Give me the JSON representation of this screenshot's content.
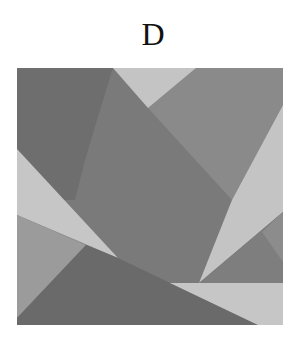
{
  "label": "D",
  "figure": {
    "colors": {
      "dark": "#6e6e6e",
      "dark_center": "#7a7a7a",
      "medium": "#888888",
      "medium_light": "#9b9b9b",
      "light": "#c4c4c4",
      "bottom_dark": "#6a6a6a"
    },
    "polygons": [
      {
        "name": "base-square",
        "fill": "#7a7a7a",
        "points": "17,68 283,68 283,325 17,325"
      },
      {
        "name": "upper-left-dark",
        "fill": "#6e6e6e",
        "points": "17,68 113,68 100,110 85,160 75,200 17,200"
      },
      {
        "name": "upper-right-medium",
        "fill": "#8a8a8a",
        "points": "148,108 196,68 283,68 283,105 232,200"
      },
      {
        "name": "top-light-triangle",
        "fill": "#c4c4c4",
        "points": "113,68 196,68 148,108"
      },
      {
        "name": "left-light-wedge",
        "fill": "#c6c6c6",
        "points": "17,149 118,258 17,215"
      },
      {
        "name": "bottom-left-medium",
        "fill": "#9b9b9b",
        "points": "17,215 86,245 17,318"
      },
      {
        "name": "bottom-dark",
        "fill": "#6a6a6a",
        "points": "86,245 118,258 258,325 17,325 17,318"
      },
      {
        "name": "right-light-wedge",
        "fill": "#c4c4c4",
        "points": "283,105 283,212 199,283 232,200"
      },
      {
        "name": "right-medium-triangle",
        "fill": "#7e7e7e",
        "points": "283,212 283,283 199,283"
      },
      {
        "name": "right-inner-light-triangle",
        "fill": "#8c8c8c",
        "points": "283,212 283,262 262,232"
      },
      {
        "name": "bottom-light-band",
        "fill": "#c6c6c6",
        "points": "170,283 283,283 283,325 258,325"
      }
    ]
  }
}
